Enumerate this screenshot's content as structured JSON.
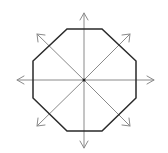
{
  "diagram": {
    "colors": {
      "octagon_stroke": "#2a2a2a",
      "arrow_stroke": "#8a8a8a",
      "center_dot": "#222222",
      "background": "#ffffff"
    },
    "center": [
      84,
      80
    ],
    "octagon_points": [
      [
        67,
        29
      ],
      [
        102,
        29
      ],
      [
        136,
        61
      ],
      [
        136,
        98
      ],
      [
        102,
        131
      ],
      [
        67,
        131
      ],
      [
        33,
        98
      ],
      [
        33,
        61
      ]
    ],
    "arrows": [
      {
        "name": "arrow-up",
        "to": [
          84,
          13
        ]
      },
      {
        "name": "arrow-down",
        "to": [
          84,
          148
        ]
      },
      {
        "name": "arrow-left",
        "to": [
          17,
          80
        ]
      },
      {
        "name": "arrow-right",
        "to": [
          154,
          80
        ]
      },
      {
        "name": "arrow-up-left",
        "to": [
          37,
          34
        ]
      },
      {
        "name": "arrow-up-right",
        "to": [
          130,
          34
        ]
      },
      {
        "name": "arrow-down-left",
        "to": [
          37,
          126
        ]
      },
      {
        "name": "arrow-down-right",
        "to": [
          130,
          126
        ]
      }
    ]
  }
}
